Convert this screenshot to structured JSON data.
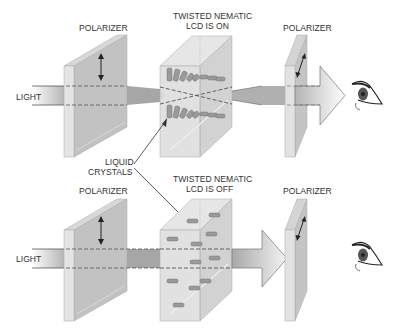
{
  "diagram": {
    "colors": {
      "background": "#ffffff",
      "text": "#333333",
      "polarizer_face": "#c4c4c4",
      "polarizer_side": "#e2e2e2",
      "polarizer_top": "#d4d4d4",
      "lcd_face": "#dcdcdc",
      "lcd_side": "#d0d0d0",
      "beam": "#a8a8a8",
      "beam_light": "#ececec",
      "crystal": "#9a9a9a",
      "line": "#444444"
    },
    "top_panel": {
      "state": "on",
      "labels": {
        "left_polarizer": "POLARIZER",
        "lcd_line1": "TWISTED NEMATIC",
        "lcd_line2": "LCD IS ON",
        "right_polarizer": "POLARIZER",
        "light": "LIGHT"
      },
      "result": "light passes through to eye"
    },
    "bottom_panel": {
      "state": "off",
      "labels": {
        "left_polarizer": "POLARIZER",
        "lcd_line1": "TWISTED NEMATIC",
        "lcd_line2": "LCD IS OFF",
        "right_polarizer": "POLARIZER",
        "light": "LIGHT"
      },
      "result": "light blocked at second polarizer"
    },
    "callout": {
      "line1": "LIQUID",
      "line2": "CRYSTALS"
    },
    "icons": [
      "polarization-arrow-icon",
      "eye-icon",
      "light-arrow-icon"
    ]
  }
}
